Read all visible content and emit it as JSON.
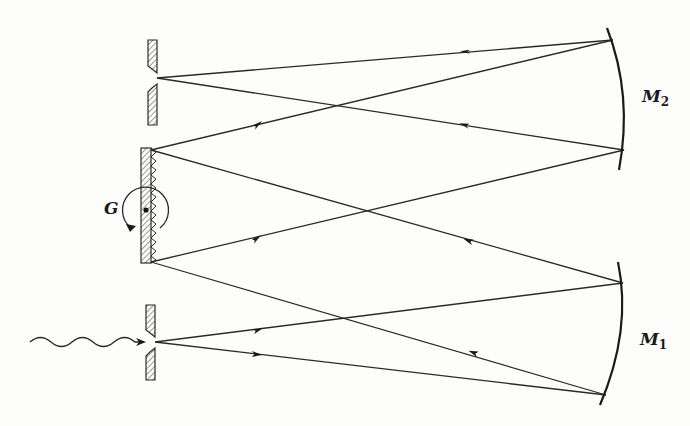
{
  "diagram": {
    "labels": {
      "grating": "G",
      "mirror_1_main": "M",
      "mirror_1_sub": "1",
      "mirror_2_main": "M",
      "mirror_2_sub": "2"
    },
    "components": [
      {
        "id": "entrance-slit",
        "type": "slit",
        "position": [
          155,
          342
        ]
      },
      {
        "id": "exit-slit",
        "type": "slit",
        "position": [
          157,
          78
        ]
      },
      {
        "id": "grating",
        "type": "rotatable-reflection-grating",
        "center": [
          146,
          210
        ]
      },
      {
        "id": "mirror-1",
        "type": "concave-mirror",
        "label": "M1"
      },
      {
        "id": "mirror-2",
        "type": "concave-mirror",
        "label": "M2"
      }
    ],
    "input": "wavy-arrow light input entering entrance slit",
    "colors": {
      "background": "#fdfdfc",
      "ink": "#1a1a1a",
      "hatch": "#555555"
    }
  }
}
